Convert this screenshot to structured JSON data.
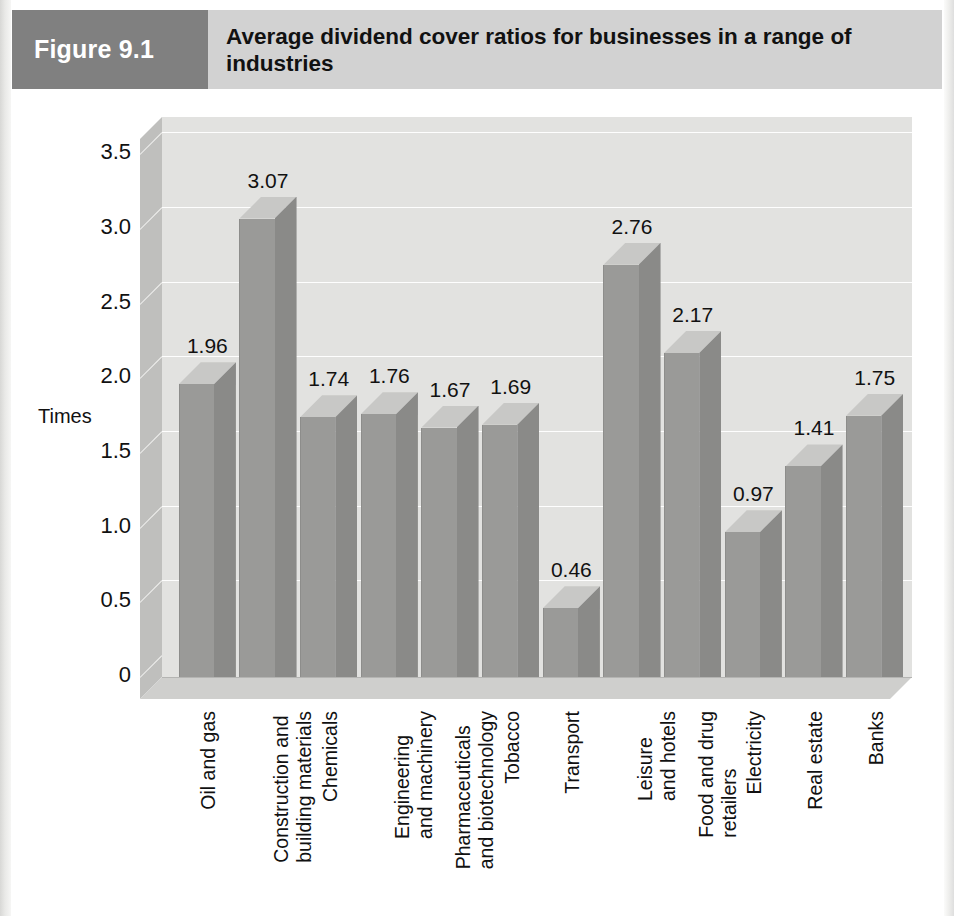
{
  "header": {
    "figure_number": "Figure 9.1",
    "title": "Average dividend cover ratios for businesses in a range of industries"
  },
  "chart_data": {
    "type": "bar",
    "title": "Average dividend cover ratios for businesses in a range of industries",
    "xlabel": "",
    "ylabel": "Times",
    "ylim": [
      0,
      3.75
    ],
    "yticks": [
      "3.5",
      "3.0",
      "2.5",
      "2.0",
      "1.5",
      "1.0",
      "0.5",
      "0"
    ],
    "ytick_values": [
      3.5,
      3.0,
      2.5,
      2.0,
      1.5,
      1.0,
      0.5,
      0
    ],
    "grid": true,
    "legend": "none",
    "style": "3d-column",
    "categories": [
      "Oil and gas",
      "Construction and building materials",
      "Chemicals",
      "Engineering and machinery",
      "Pharmaceuticals and biotechnology",
      "Tobacco",
      "Transport",
      "Leisure and hotels",
      "Food and drug retailers",
      "Electricity",
      "Real estate",
      "Banks"
    ],
    "category_lines": [
      [
        "Oil and gas"
      ],
      [
        "Construction and",
        "building materials"
      ],
      [
        "Chemicals"
      ],
      [
        "Engineering",
        "and machinery"
      ],
      [
        "Pharmaceuticals",
        "and biotechnology"
      ],
      [
        "Tobacco"
      ],
      [
        "Transport"
      ],
      [
        "Leisure",
        "and hotels"
      ],
      [
        "Food and drug",
        "retailers"
      ],
      [
        "Electricity"
      ],
      [
        "Real estate"
      ],
      [
        "Banks"
      ]
    ],
    "values": [
      1.96,
      3.07,
      1.74,
      1.76,
      1.67,
      1.69,
      0.46,
      2.76,
      2.17,
      0.97,
      1.41,
      1.75
    ],
    "value_labels": [
      "1.96",
      "3.07",
      "1.74",
      "1.76",
      "1.67",
      "1.69",
      "0.46",
      "2.76",
      "2.17",
      "0.97",
      "1.41",
      "1.75"
    ]
  },
  "colors": {
    "badge_bg": "#808080",
    "header_bg": "#d2d2d2",
    "bar_front": "#9a9a98",
    "bar_side": "#8a8a88",
    "bar_top": "#c8c8c6",
    "backwall": "#e2e2e0",
    "floor": "#cfcfcd",
    "text": "#111111"
  }
}
